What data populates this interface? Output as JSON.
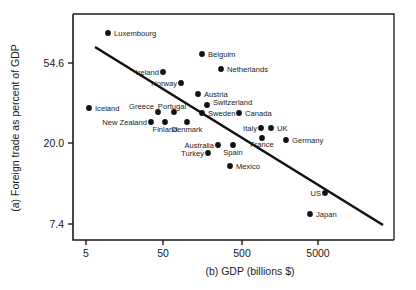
{
  "chart_data": {
    "type": "scatter",
    "title": "",
    "xlabel": "(b) GDP (billions $)",
    "ylabel": "(a) Foreign trade as percent of GDP",
    "xscale": "log",
    "xticks": [
      5,
      50,
      500,
      5000
    ],
    "xtick_labels": [
      "5",
      "50",
      "500",
      "5000"
    ],
    "yticks": [
      7.4,
      20.0,
      54.6
    ],
    "ytick_labels": [
      "7.4",
      "20.0",
      "54.6"
    ],
    "yscale": "log",
    "grid": false,
    "legend": "none",
    "points": [
      {
        "label": "Luxembourg",
        "x": 9.5,
        "y": 90.0,
        "px": 108,
        "py": 33,
        "lx": 114,
        "ly": 36,
        "anchor": "start"
      },
      {
        "label": "Belguim",
        "x": 250,
        "y": 72.0,
        "px": 202,
        "py": 54,
        "lx": 208,
        "ly": 57,
        "anchor": "start"
      },
      {
        "label": "Netherlands",
        "x": 380,
        "y": 61.0,
        "px": 221,
        "py": 69,
        "lx": 227,
        "ly": 72,
        "anchor": "start"
      },
      {
        "label": "Ireland",
        "x": 65,
        "y": 60.0,
        "px": 163,
        "py": 72,
        "lx": 159,
        "ly": 75,
        "anchor": "end"
      },
      {
        "label": "Norway",
        "x": 120,
        "y": 53.0,
        "px": 181,
        "py": 83,
        "lx": 177,
        "ly": 86,
        "anchor": "end"
      },
      {
        "label": "Austria",
        "x": 190,
        "y": 47.0,
        "px": 198,
        "py": 94,
        "lx": 204,
        "ly": 97,
        "anchor": "start"
      },
      {
        "label": "Switzerland",
        "x": 240,
        "y": 41.0,
        "px": 207,
        "py": 105,
        "lx": 213,
        "ly": 105,
        "anchor": "start"
      },
      {
        "label": "Greece",
        "x": 58,
        "y": 37.0,
        "px": 158,
        "py": 112,
        "lx": 154,
        "ly": 109,
        "anchor": "end"
      },
      {
        "label": "Portugal",
        "x": 80,
        "y": 37.0,
        "px": 174,
        "py": 112,
        "lx": 172,
        "ly": 109,
        "anchor": "middle"
      },
      {
        "label": "Sweden",
        "x": 215,
        "y": 37.0,
        "px": 202,
        "py": 113,
        "lx": 208,
        "ly": 116,
        "anchor": "start"
      },
      {
        "label": "Canada",
        "x": 560,
        "y": 37.0,
        "px": 239,
        "py": 113,
        "lx": 245,
        "ly": 116,
        "anchor": "start"
      },
      {
        "label": "Iceland",
        "x": 6.5,
        "y": 39.0,
        "px": 89,
        "py": 108,
        "lx": 95,
        "ly": 111,
        "anchor": "start"
      },
      {
        "label": "New Zealand",
        "x": 45,
        "y": 32.0,
        "px": 151,
        "py": 122,
        "lx": 147,
        "ly": 125,
        "anchor": "end"
      },
      {
        "label": "Finland",
        "x": 68,
        "y": 32.0,
        "px": 165,
        "py": 122,
        "lx": 165,
        "ly": 132,
        "anchor": "middle"
      },
      {
        "label": "Denmark",
        "x": 120,
        "y": 32.0,
        "px": 187,
        "py": 122,
        "lx": 187,
        "ly": 132,
        "anchor": "middle"
      },
      {
        "label": "Italy",
        "x": 1000,
        "y": 28.0,
        "px": 261,
        "py": 128,
        "lx": 257,
        "ly": 131,
        "anchor": "end"
      },
      {
        "label": "UK",
        "x": 1100,
        "y": 28.0,
        "px": 271,
        "py": 128,
        "lx": 277,
        "ly": 131,
        "anchor": "start"
      },
      {
        "label": "France",
        "x": 1050,
        "y": 25.0,
        "px": 262,
        "py": 138,
        "lx": 262,
        "ly": 147,
        "anchor": "middle"
      },
      {
        "label": "Germany",
        "x": 1700,
        "y": 24.5,
        "px": 286,
        "py": 140,
        "lx": 292,
        "ly": 143,
        "anchor": "start"
      },
      {
        "label": "Australia",
        "x": 320,
        "y": 23.0,
        "px": 218,
        "py": 145,
        "lx": 214,
        "ly": 148,
        "anchor": "end"
      },
      {
        "label": "Spain",
        "x": 480,
        "y": 23.0,
        "px": 233,
        "py": 145,
        "lx": 233,
        "ly": 155,
        "anchor": "middle"
      },
      {
        "label": "Turkey",
        "x": 200,
        "y": 21.0,
        "px": 208,
        "py": 153,
        "lx": 204,
        "ly": 156,
        "anchor": "end"
      },
      {
        "label": "Mexico",
        "x": 410,
        "y": 17.5,
        "px": 230,
        "py": 166,
        "lx": 236,
        "ly": 169,
        "anchor": "start"
      },
      {
        "label": "US",
        "x": 5000,
        "y": 11.0,
        "px": 325,
        "py": 193,
        "lx": 321,
        "ly": 196,
        "anchor": "end"
      },
      {
        "label": "Japan",
        "x": 3000,
        "y": 8.8,
        "px": 310,
        "py": 214,
        "lx": 316,
        "ly": 217,
        "anchor": "start"
      }
    ],
    "trend_line": {
      "x1_px": 95,
      "y1_px": 47,
      "x2_px": 383,
      "y2_px": 225,
      "description": "downward sloping regression line"
    },
    "axis": {
      "left_px": 73,
      "right_px": 394,
      "top_px": 14,
      "bottom_px": 240
    }
  }
}
